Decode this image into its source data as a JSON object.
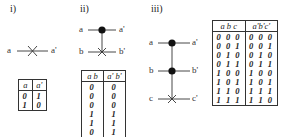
{
  "panels": [
    {
      "title": "i)",
      "wires": [
        {
          "in": "a",
          "out": "a'"
        }
      ],
      "table": {
        "headers": [
          "a",
          "a'"
        ],
        "rows": [
          [
            "0",
            "1"
          ],
          [
            "1",
            "0"
          ]
        ]
      }
    },
    {
      "title": "ii)",
      "wires": [
        {
          "in": "a",
          "out": "a'"
        },
        {
          "in": "b",
          "out": "b'"
        }
      ],
      "table": {
        "headers": [
          "a b",
          "a' b'"
        ],
        "rows": [
          [
            "0 0",
            "0 0"
          ],
          [
            "0 1",
            "0 1"
          ],
          [
            "1 0",
            "1 1"
          ],
          [
            "1 1",
            "1 0"
          ]
        ]
      }
    },
    {
      "title": "iii)",
      "wires": [
        {
          "in": "a",
          "out": "a'"
        },
        {
          "in": "b",
          "out": "b'"
        },
        {
          "in": "c",
          "out": "c'"
        }
      ],
      "table": {
        "headers": [
          "a b c",
          "a'b'c'"
        ],
        "rows": [
          [
            "0 0 0",
            "0 0 0"
          ],
          [
            "0 0 1",
            "0 0 1"
          ],
          [
            "0 1 0",
            "0 1 0"
          ],
          [
            "0 1 1",
            "0 1 1"
          ],
          [
            "1 0 0",
            "1 0 0"
          ],
          [
            "1 0 1",
            "1 0 1"
          ],
          [
            "1 1 0",
            "1 1 1"
          ],
          [
            "1 1 1",
            "1 1 0"
          ]
        ]
      }
    }
  ]
}
